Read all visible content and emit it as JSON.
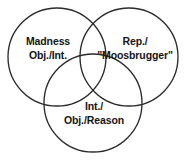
{
  "diagram": {
    "type": "venn",
    "title": "",
    "background_color": "#ffffff",
    "stroke_color": "#2b2b2b",
    "text_color": "#141414",
    "sets": [
      {
        "id": "madness",
        "position": "left",
        "lines": [
          "Madness",
          "Obj./Int."
        ],
        "line1": "Madness",
        "line2": "Obj./Int.",
        "center_x": 57,
        "center_y": 57,
        "radius": 49
      },
      {
        "id": "representation",
        "position": "right",
        "lines": [
          "Rep./",
          "\"Moosbrugger\""
        ],
        "line1": "Rep./",
        "line2": "\"Moosbrugger\"",
        "center_x": 129,
        "center_y": 57,
        "radius": 49
      },
      {
        "id": "reason",
        "position": "bottom",
        "lines": [
          "Int./",
          "Obj./Reason"
        ],
        "line1": "Int./",
        "line2": "Obj./Reason",
        "center_x": 93,
        "center_y": 103,
        "radius": 49
      }
    ]
  }
}
